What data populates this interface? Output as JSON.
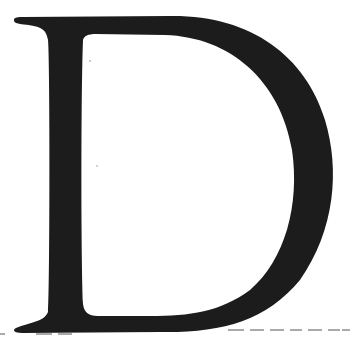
{
  "glyph": {
    "character": "D",
    "style": "serif capital",
    "fill_color": "#1c1c1c",
    "background_color": "#ffffff"
  },
  "baseline": {
    "style": "dashed",
    "color": "#555555"
  }
}
